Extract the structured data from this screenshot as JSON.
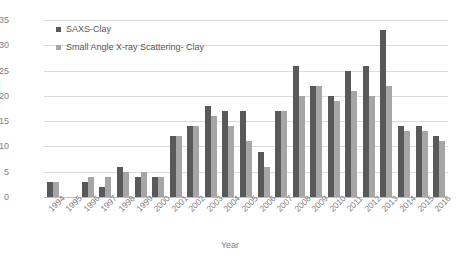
{
  "chart_data": {
    "type": "bar",
    "title": "",
    "xlabel": "Year",
    "ylabel": "Articles",
    "ylim": [
      0,
      35
    ],
    "ytick_step": 5,
    "yticks": [
      35,
      30,
      25,
      20,
      15,
      10,
      5,
      0
    ],
    "grid": true,
    "legend_position": "top-left",
    "categories": [
      "1994",
      "1995",
      "1996",
      "1997",
      "1998",
      "1999",
      "2000",
      "2001",
      "2002",
      "2003",
      "2004",
      "2005",
      "2006",
      "2007",
      "2008",
      "2009",
      "2010",
      "2011",
      "2012",
      "2013",
      "2014",
      "2015",
      "2016"
    ],
    "series": [
      {
        "name": "SAXS-Clay",
        "color": "#595959",
        "values": [
          3,
          0,
          3,
          2,
          6,
          4,
          4,
          12,
          14,
          18,
          17,
          17,
          9,
          17,
          26,
          22,
          20,
          25,
          26,
          33,
          14,
          14,
          12
        ]
      },
      {
        "name": "Small Angle X-ray Scattering- Clay",
        "color": "#a6a6a6",
        "values": [
          3,
          0,
          4,
          4,
          5,
          5,
          4,
          12,
          14,
          16,
          14,
          11,
          6,
          17,
          20,
          22,
          19,
          21,
          20,
          22,
          13,
          13,
          11
        ]
      }
    ]
  },
  "legend": {
    "items": [
      {
        "label": "SAXS-Clay"
      },
      {
        "label": "Small Angle X-ray Scattering- Clay"
      }
    ]
  },
  "axes": {
    "y_title": "Articles",
    "x_title": "Year"
  }
}
